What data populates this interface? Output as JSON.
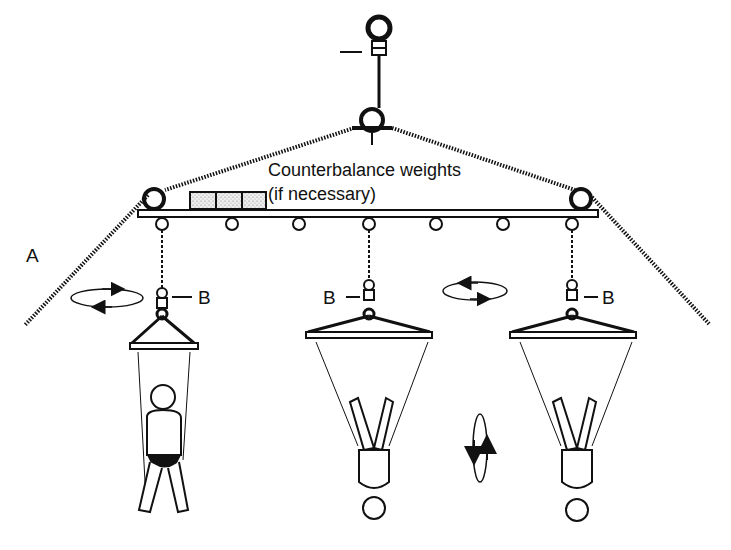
{
  "diagram": {
    "title_label": "Counterbalance weights",
    "subtitle_label": "(if necessary)",
    "label_a": "A",
    "label_b_left": "B",
    "label_b_center": "B",
    "label_b_right": "B",
    "colors": {
      "ink": "#111111",
      "background": "#ffffff",
      "weight_fill": "#e6e6e6"
    }
  }
}
